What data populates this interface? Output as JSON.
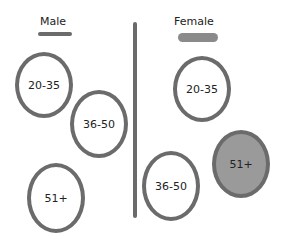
{
  "groups": {
    "male": {
      "label": "Male",
      "underline_color": "#6b6b6b",
      "items": [
        {
          "label": "20-35",
          "filled": false
        },
        {
          "label": "36-50",
          "filled": false
        },
        {
          "label": "51+",
          "filled": false
        }
      ]
    },
    "female": {
      "label": "Female",
      "underline_color": "#8a8a8a",
      "items": [
        {
          "label": "20-35",
          "filled": false
        },
        {
          "label": "36-50",
          "filled": false
        },
        {
          "label": "51+",
          "filled": true
        }
      ]
    }
  },
  "colors": {
    "stroke": "#6b6b6b",
    "fill": "#9a9a9a"
  }
}
